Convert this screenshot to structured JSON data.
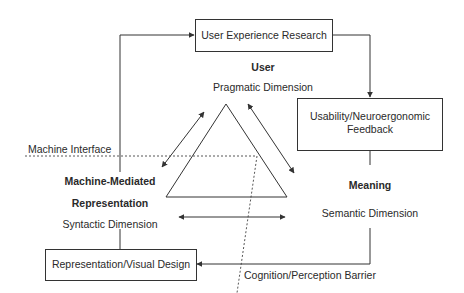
{
  "boxes": {
    "user_experience_research": "User Experience Research",
    "usability_feedback_line1": "Usability/Neuroergonomic",
    "usability_feedback_line2": "Feedback",
    "representation_visual_design": "Representation/Visual Design"
  },
  "nodes": {
    "user": {
      "title": "User",
      "subtitle": "Pragmatic Dimension"
    },
    "meaning": {
      "title": "Meaning",
      "subtitle": "Semantic Dimension"
    },
    "representation": {
      "title_line1": "Machine-Mediated",
      "title_line2": "Representation",
      "subtitle": "Syntactic Dimension"
    }
  },
  "boundaries": {
    "machine_interface": "Machine Interface",
    "cognition_barrier": "Cognition/Perception Barrier"
  },
  "colors": {
    "line": "#333333",
    "text": "#2a2a2a",
    "background": "#ffffff"
  }
}
